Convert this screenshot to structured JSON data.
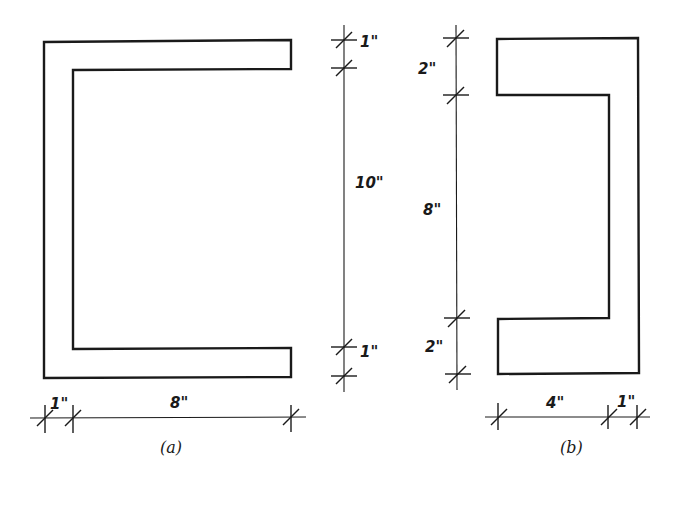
{
  "figure_a": {
    "caption": "(a)",
    "dimensions": {
      "top_flange_thickness": "1\"",
      "web_height": "10\"",
      "bottom_flange_thickness": "1\"",
      "web_thickness": "1\"",
      "flange_length": "8\""
    },
    "description": "Channel (C) section opening right: 1\" web, 8\" flanges, 1\" flange thickness, 10\" clear height"
  },
  "figure_b": {
    "caption": "(b)",
    "dimensions": {
      "top_flange_height": "2\"",
      "web_clear_height": "8\"",
      "bottom_flange_height": "2\"",
      "flange_length": "4\"",
      "web_thickness": "1\""
    },
    "description": "Channel section opening left: 1\" web, 4\" flanges, 2\" flange thickness, 8\" clear height"
  },
  "colors": {
    "line": "#1a1a1a",
    "background": "#ffffff"
  }
}
